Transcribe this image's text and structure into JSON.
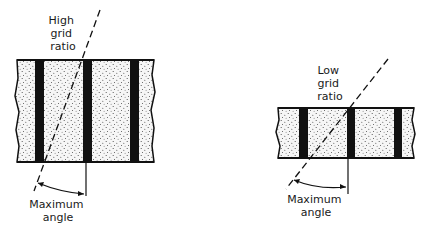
{
  "diagram": {
    "type": "grid-ratio-comparison",
    "colors": {
      "ink": "#111111",
      "fill": "#f4f4f4",
      "dots": "#444444",
      "background": "#ffffff"
    },
    "panels": [
      {
        "id": "high",
        "label_lines": [
          "High",
          "grid",
          "ratio"
        ],
        "bottom_label_lines": [
          "Maximum",
          "angle"
        ]
      },
      {
        "id": "low",
        "label_lines": [
          "Low",
          "grid",
          "ratio"
        ],
        "bottom_label_lines": [
          "Maximum",
          "angle"
        ]
      }
    ]
  }
}
